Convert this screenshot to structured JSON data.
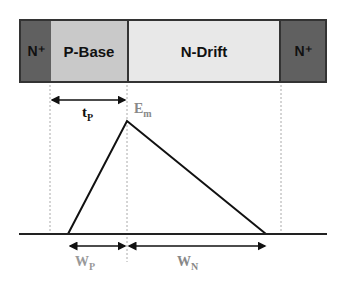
{
  "device": {
    "regions": [
      {
        "label": "N⁺",
        "fill": "#606060"
      },
      {
        "label": "P-Base",
        "fill": "#c9c9c9"
      },
      {
        "label": "N-Drift",
        "fill": "#e8e8e8"
      },
      {
        "label": "N⁺",
        "fill": "#606060"
      }
    ]
  },
  "labels": {
    "tp": "t",
    "tp_sub": "P",
    "em": "E",
    "em_sub": "m",
    "wp": "W",
    "wp_sub": "P",
    "wn": "W",
    "wn_sub": "N"
  }
}
